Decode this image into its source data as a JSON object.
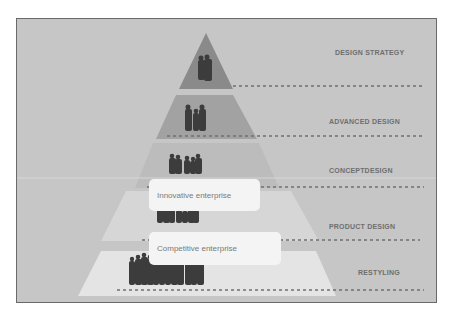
{
  "diagram": {
    "type": "pyramid",
    "levels": [
      {
        "label": "DESIGN STRATEGY",
        "people": 2,
        "color": "#8a8a8a"
      },
      {
        "label": "ADVANCED DESIGN",
        "people": 3,
        "color": "#a2a2a2"
      },
      {
        "label": "CONCEPTDESIGN",
        "people": 5,
        "color": "#bcbcbc"
      },
      {
        "label": "PRODUCT DESIGN",
        "people": 7,
        "color": "#d6d6d6"
      },
      {
        "label": "RESTYLING",
        "people": 12,
        "color": "#e4e4e4"
      }
    ],
    "callouts": [
      {
        "text": "Innovative enterprise"
      },
      {
        "text": "Competitive enterprise"
      }
    ],
    "colors": {
      "background": "#c6c6c6",
      "frame_border": "#6a6a6a",
      "label": "#6e6e6e",
      "dotted_line": "#707070",
      "silhouette": "#3c3c3c"
    }
  }
}
